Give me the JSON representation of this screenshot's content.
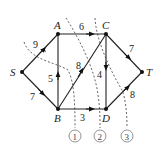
{
  "diagram": {
    "type": "network-flow-cuts",
    "nodes": [
      {
        "id": "S",
        "label": "S",
        "x": 22,
        "y": 72
      },
      {
        "id": "A",
        "label": "A",
        "x": 58,
        "y": 34
      },
      {
        "id": "C",
        "label": "C",
        "x": 106,
        "y": 34
      },
      {
        "id": "T",
        "label": "T",
        "x": 142,
        "y": 72
      },
      {
        "id": "B",
        "label": "B",
        "x": 58,
        "y": 109
      },
      {
        "id": "D",
        "label": "D",
        "x": 106,
        "y": 109
      }
    ],
    "edges": [
      {
        "from": "S",
        "to": "A",
        "capacity": "9"
      },
      {
        "from": "S",
        "to": "B",
        "capacity": "7"
      },
      {
        "from": "B",
        "to": "A",
        "capacity": "5"
      },
      {
        "from": "A",
        "to": "C",
        "capacity": "6"
      },
      {
        "from": "B",
        "to": "C",
        "capacity": "8"
      },
      {
        "from": "C",
        "to": "D",
        "capacity": "4"
      },
      {
        "from": "B",
        "to": "D",
        "capacity": "3"
      },
      {
        "from": "C",
        "to": "T",
        "capacity": "7"
      },
      {
        "from": "D",
        "to": "T",
        "capacity": "8"
      }
    ],
    "cuts": [
      {
        "label": "1"
      },
      {
        "label": "2"
      },
      {
        "label": "3"
      }
    ]
  }
}
